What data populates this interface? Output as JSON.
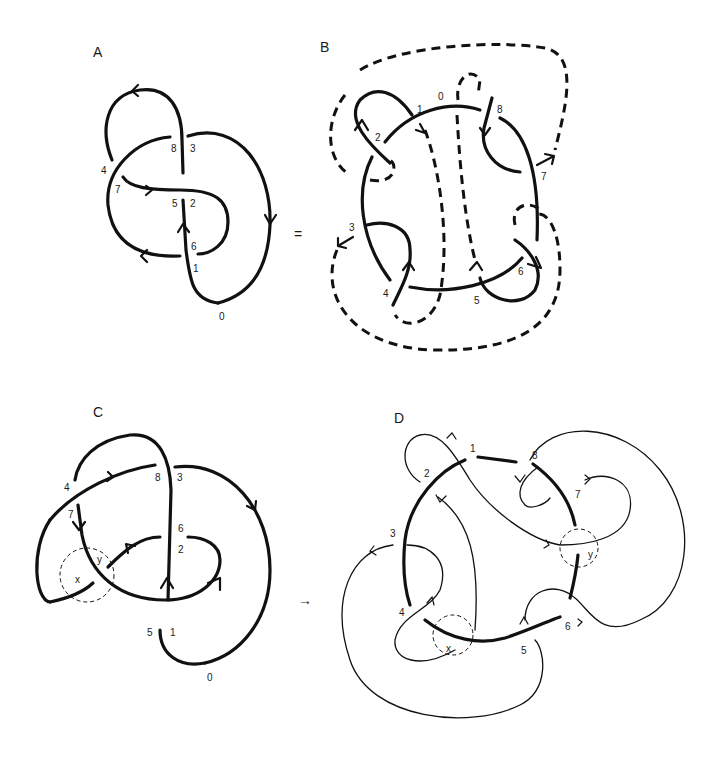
{
  "figure": {
    "panels": [
      {
        "id": "A",
        "label": "A",
        "crossing_labels": [
          "8",
          "3",
          "4",
          "7",
          "5",
          "2",
          "6",
          "1",
          "0"
        ]
      },
      {
        "id": "B",
        "label": "B",
        "crossing_labels": [
          "0",
          "1",
          "8",
          "2",
          "7",
          "3",
          "6",
          "4",
          "5"
        ]
      },
      {
        "id": "C",
        "label": "C",
        "crossing_labels": [
          "4",
          "8",
          "3",
          "7",
          "6",
          "2",
          "5",
          "1",
          "0"
        ],
        "region_labels": [
          "x",
          "y"
        ]
      },
      {
        "id": "D",
        "label": "D",
        "crossing_labels": [
          "1",
          "8",
          "2",
          "7",
          "3",
          "4",
          "5",
          "6"
        ],
        "region_labels": [
          "x",
          "y"
        ]
      }
    ],
    "operators": {
      "equals": "=",
      "arrow": "→"
    }
  }
}
